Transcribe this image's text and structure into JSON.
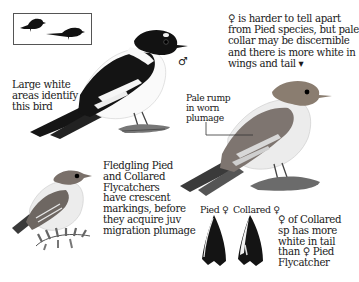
{
  "plate": {
    "subject": "Pied and Collared Flycatcher identification plate",
    "silhouette_box": {
      "icons": [
        "perched-bird-silhouette",
        "flying-bird-silhouette"
      ]
    },
    "male": {
      "sex_symbol": "♂",
      "caption": "Large white\nareas identify\nthis bird"
    },
    "female": {
      "caption": "♀ is harder to tell apart\nfrom Pied species, but pale\ncollar may be discernible\nand there is more white in\nwings and tail ▾",
      "rump_callout": "Pale rump\nin worn\nplumage"
    },
    "fledgling": {
      "caption": "Fledgling Pied\nand Collared\nFlycatchers\nhave crescent\nmarkings, before\nthey acquire juv\nmigration plumage"
    },
    "tails": {
      "items": [
        {
          "label": "Pied ♀"
        },
        {
          "label": "Collared ♀"
        }
      ],
      "caption": "♀ of Collared\nsp has more\nwhite in tail\nthan ♀ Pied\nFlycatcher"
    },
    "colors": {
      "ink": "#1a1a1a",
      "background": "#ffffff",
      "female_brown": "#8a7d70",
      "perch": "#6b6b6b"
    }
  }
}
